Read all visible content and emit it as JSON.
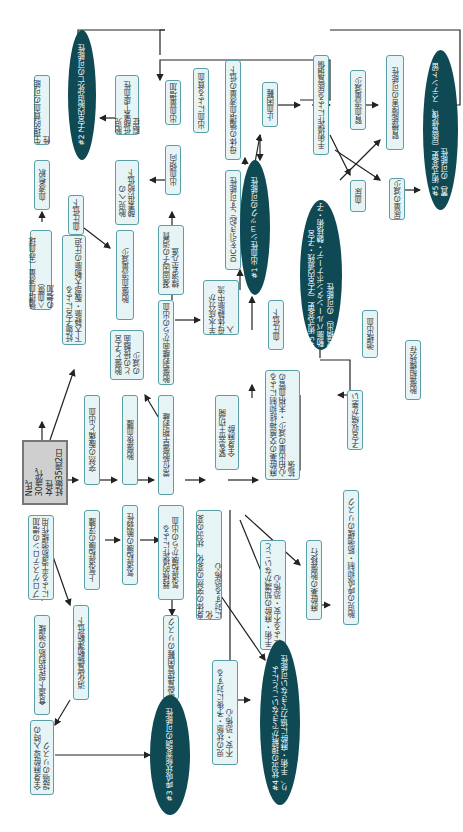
{
  "patient": {
    "label": "N氏、\n30歳代、\n女性\n妊娠35週2日"
  },
  "diagnoses": [
    {
      "id": "d1",
      "label": "#1 出血性ショックの可能性"
    },
    {
      "id": "d2",
      "label": "#2 子宮内胎児死亡の可能性"
    },
    {
      "id": "d3",
      "label": "#3 呼吸状態変調の可能性"
    },
    {
      "id": "d4",
      "label": "#4 状況の理解ができないことによ\nり、手術・麻酔に協力できない可能性"
    },
    {
      "id": "d5a",
      "label": "#5 術式変更（子宮内遺残・子宮\n動脈バルーンタンポナーデ・髄核術・子\n宮摘出）の可能性"
    },
    {
      "id": "d5b",
      "label": "#5 術式変更（尿管修復、ステント留\n置）の可能性"
    }
  ],
  "boxes": [
    {
      "id": "b1",
      "label": "循環血液量（赤血球＜血漿）\nの増加"
    },
    {
      "id": "b2",
      "label": "血液希釈"
    },
    {
      "id": "b3",
      "label": "生理的貧血の可能性"
    },
    {
      "id": "b4",
      "label": "妊娠子宮による\n下大静脈・腹部大動脈の圧迫"
    },
    {
      "id": "b5",
      "label": "血圧低下"
    },
    {
      "id": "b6",
      "label": "胎盤血流量減少"
    },
    {
      "id": "b7",
      "label": "胎児への\n酸素供給低下"
    },
    {
      "id": "b8",
      "label": "胎児\n低酸素─虚血性脳症"
    },
    {
      "id": "b9",
      "label": "突然の腹痛と出血"
    },
    {
      "id": "b10",
      "label": "胎盤後血腫"
    },
    {
      "id": "b11",
      "label": "胎盤と子宮\nとの接触面\nの減少"
    },
    {
      "id": "b12",
      "label": "常位胎盤早期剥離"
    },
    {
      "id": "b13",
      "label": "胎盤剥離面からの出血"
    },
    {
      "id": "b14",
      "label": "凝固因子の消費\n線溶系亢進"
    },
    {
      "id": "b15",
      "label": "出血傾向"
    },
    {
      "id": "b16",
      "label": "出血量増加"
    },
    {
      "id": "b17",
      "label": "羊水成分が\n母体静脈中流入"
    },
    {
      "id": "b18",
      "label": "DICを引き起こす可能性"
    },
    {
      "id": "b19",
      "label": "出血による貧血"
    },
    {
      "id": "b20",
      "label": "母体の循環血液量の低下"
    },
    {
      "id": "b21",
      "label": "止血困難"
    },
    {
      "id": "b22",
      "label": "血圧低下"
    },
    {
      "id": "b23",
      "label": "麻酔薬の交感神経抑制による\n心拍出量の減少・末梢血管の\n拡張"
    },
    {
      "id": "b24",
      "label": "緊急帝王切開\n全身麻酔"
    },
    {
      "id": "b25",
      "label": "手術操作による尿管損傷"
    },
    {
      "id": "b26",
      "label": "腎血流量減少"
    },
    {
      "id": "b27",
      "label": "腎機能障害の可能性"
    },
    {
      "id": "b28",
      "label": "血尿"
    },
    {
      "id": "b29",
      "label": "尿量の減少"
    },
    {
      "id": "b30",
      "label": "弛緩出血"
    },
    {
      "id": "b31",
      "label": "胎盤組織残存"
    },
    {
      "id": "b32",
      "label": "子宮収縮が悪い"
    },
    {
      "id": "b33",
      "label": "プロゲステロンの増加\nによる平滑筋弛緩作用"
    },
    {
      "id": "b34",
      "label": "上気道粘膜の浮腫"
    },
    {
      "id": "b35",
      "label": "気道粘膜の脆弱性"
    },
    {
      "id": "b36",
      "label": "器械的操作による\n気道粘膜からの出血"
    },
    {
      "id": "b37",
      "label": "気管挿管困難のリスク"
    },
    {
      "id": "b38",
      "label": "食道下部括約筋の弛緩"
    },
    {
      "id": "b39",
      "label": "消化管蠕動運動低下"
    },
    {
      "id": "b40",
      "label": "全身麻酔導入時の\n誤嚥のリスク"
    },
    {
      "id": "b41",
      "label": "身体の突然の変化、状況の変化\nに対する恐怖心"
    },
    {
      "id": "b42",
      "label": "児の状態・予後に対する\n不安・恐怖心"
    },
    {
      "id": "b43",
      "label": "手術・麻酔の知識がないこと\nによる不安・恐怖心"
    },
    {
      "id": "b44",
      "label": "麻酔薬の胎盤移行"
    },
    {
      "id": "b45",
      "label": "胎児の呼吸抑制・筋弛緩のリスク"
    }
  ],
  "colors": {
    "box_fill": "#e6f4f6",
    "box_border": "#5a9fa8",
    "diagnosis_fill": "#0f4a54",
    "patient_fill": "#cfcfcf"
  }
}
